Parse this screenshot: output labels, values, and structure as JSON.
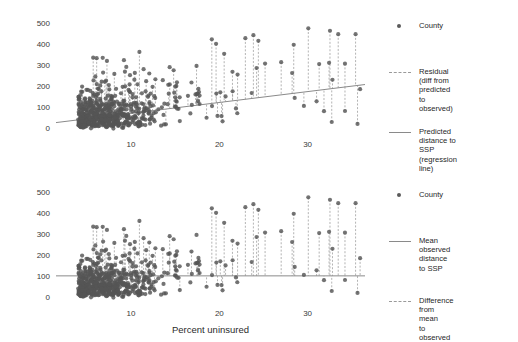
{
  "figure": {
    "width": 518,
    "height": 338,
    "background": "#ffffff",
    "point_color": "#555555",
    "line_color": "#8a8a8a",
    "dash_color": "#9a9a9a"
  },
  "axes": {
    "x_label": "Percent uninsured",
    "y_label": "Miles to syringe program",
    "x_ticks": [
      10,
      20,
      30
    ],
    "y_ticks": [
      0,
      100,
      200,
      300,
      400,
      500
    ],
    "xlim": [
      1.5,
      36.5
    ],
    "ylim": [
      -20,
      530
    ]
  },
  "panels": [
    {
      "id": "top",
      "legend": [
        {
          "key": "dot",
          "label": "County"
        },
        {
          "key": "dash",
          "label": "Residual (diff from\npredicted to observed)"
        },
        {
          "key": "solid",
          "label": "Predicted distance to\nSSP (regression line)"
        }
      ],
      "reference": {
        "type": "regression",
        "slope": 5.2,
        "intercept": 22.0
      }
    },
    {
      "id": "bottom",
      "legend": [
        {
          "key": "dot",
          "label": "County"
        },
        {
          "key": "solid",
          "label": "Mean observed\ndistance to SSP"
        },
        {
          "key": "dash",
          "label": "Difference from mean\nto observed"
        }
      ],
      "reference": {
        "type": "mean",
        "value": 105.0
      }
    }
  ],
  "chart_data": {
    "type": "scatter",
    "title": "",
    "xlabel": "Percent uninsured",
    "ylabel": "Miles to syringe program",
    "xlim": [
      1.5,
      36.5
    ],
    "ylim": [
      -20,
      530
    ],
    "xticks": [
      10,
      20,
      30
    ],
    "yticks": [
      0,
      100,
      200,
      300,
      400,
      500
    ],
    "grid": false,
    "legend_position": "right",
    "series": [
      {
        "name": "County",
        "marker": "filled-circle",
        "color": "#555555",
        "n_points": 620,
        "description": "Scatter of US counties: percent uninsured (x) vs miles to nearest syringe services program (y). Dense cluster between x=4 and x=18 with y mostly 0-250; sparse high-leverage points out to x=36 with y up to ~520."
      }
    ],
    "annotations": [
      {
        "panel": "top",
        "type": "regression-line",
        "slope": 5.2,
        "intercept": 22.0,
        "label": "Predicted distance to SSP (regression line)"
      },
      {
        "panel": "top",
        "type": "residual-segments",
        "label": "Residual (diff from predicted to observed)"
      },
      {
        "panel": "bottom",
        "type": "horizontal-line",
        "y": 105.0,
        "label": "Mean observed distance to SSP"
      },
      {
        "panel": "bottom",
        "type": "deviation-segments",
        "label": "Difference from mean to observed"
      }
    ]
  }
}
